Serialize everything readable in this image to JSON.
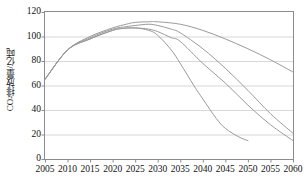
{
  "chart_data": {
    "type": "line",
    "title": "",
    "xlabel": "",
    "ylabel": "CO2排放量/亿吨",
    "ylabel_prefix": "CO",
    "ylabel_sub": "2",
    "ylabel_suffix": "排放量/亿吨",
    "xlim": [
      2005,
      2060
    ],
    "ylim": [
      0,
      120
    ],
    "xticks": [
      2005,
      2010,
      2015,
      2020,
      2025,
      2030,
      2035,
      2040,
      2045,
      2050,
      2055,
      2060
    ],
    "yticks": [
      0,
      20,
      40,
      60,
      80,
      100,
      120
    ],
    "xtick_labels": [
      "2005",
      "2010",
      "2015",
      "2020",
      "2025",
      "2030",
      "2035",
      "2040",
      "2045",
      "2050",
      "2055",
      "2060"
    ],
    "ytick_labels": [
      "0",
      "20",
      "40",
      "60",
      "80",
      "100",
      "120"
    ],
    "grid": "horizontal",
    "legend": "none",
    "line_color": "#9a9a9a",
    "grid_color": "#d8d8d8",
    "axis_color": "#8c8c8c",
    "series": [
      {
        "name": "scenario-a-steepest",
        "x": [
          2005,
          2010,
          2015,
          2020,
          2022,
          2025,
          2028,
          2030,
          2033,
          2035,
          2038,
          2040,
          2043,
          2045,
          2048,
          2050
        ],
        "values": [
          65,
          89,
          98,
          105,
          106.5,
          107,
          105,
          101,
          89,
          78,
          60,
          49,
          33,
          25,
          18,
          15
        ]
      },
      {
        "name": "scenario-b-steep",
        "x": [
          2005,
          2010,
          2015,
          2020,
          2022,
          2025,
          2028,
          2030,
          2033,
          2035,
          2040,
          2045,
          2050,
          2055,
          2060
        ],
        "values": [
          65,
          89,
          98,
          105,
          106.5,
          107,
          106,
          104,
          99,
          96,
          78,
          62,
          44,
          28,
          15
        ]
      },
      {
        "name": "scenario-c-medium",
        "x": [
          2005,
          2010,
          2015,
          2020,
          2023,
          2025,
          2028,
          2030,
          2033,
          2035,
          2040,
          2045,
          2050,
          2055,
          2060
        ],
        "values": [
          65,
          89,
          99,
          106,
          108,
          109,
          110,
          109,
          106,
          103,
          90,
          74,
          56,
          37,
          21
        ]
      },
      {
        "name": "scenario-d-shallow",
        "x": [
          2005,
          2010,
          2015,
          2020,
          2023,
          2025,
          2028,
          2030,
          2035,
          2040,
          2045,
          2050,
          2055,
          2060
        ],
        "values": [
          65,
          89,
          100,
          107,
          110,
          111.5,
          112,
          112,
          110,
          105,
          98,
          90,
          81,
          71
        ]
      }
    ]
  }
}
